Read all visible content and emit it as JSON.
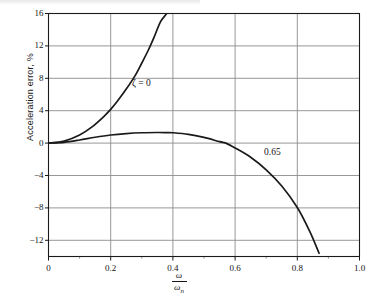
{
  "figure": {
    "background": "#ffffff",
    "ink_color": "#141414",
    "grid_color": "#8c8c8c",
    "frame_color": "#1a1a1a"
  },
  "axes": {
    "y_label": "Acceleration error, %",
    "x_label_numerator": "ω",
    "x_label_denominator": "ω",
    "x_label_denominator_sub": "n",
    "y_tick_labels": [
      "16",
      "12",
      "8",
      "4",
      "0",
      "−4",
      "−8",
      "−12"
    ],
    "y_tick_values": [
      16,
      12,
      8,
      4,
      0,
      -4,
      -8,
      -12
    ],
    "x_tick_labels": [
      "0",
      "0.2",
      "0.4",
      "0.6",
      "0.8",
      "1.0"
    ],
    "x_tick_values": [
      0,
      0.2,
      0.4,
      0.6,
      0.8,
      1.0
    ],
    "x_minor_tick_values": [
      0.1,
      0.3,
      0.5,
      0.7,
      0.9
    ]
  },
  "annotations": [
    {
      "name": "zeta-zero-label",
      "text": "ζ = 0"
    },
    {
      "name": "zeta-065-label",
      "text": "0.65"
    }
  ],
  "chart_data": {
    "type": "line",
    "title": "",
    "xlabel": "ω/ωn",
    "ylabel": "Acceleration error, %",
    "xlim": [
      0.0,
      1.0
    ],
    "ylim": [
      -14.0,
      16.0
    ],
    "grid": true,
    "legend": "inline-annotations",
    "x_ticks": [
      0,
      0.2,
      0.4,
      0.6,
      0.8,
      1.0
    ],
    "y_ticks": [
      -12,
      -8,
      -4,
      0,
      4,
      8,
      12,
      16
    ],
    "series": [
      {
        "name": "ζ = 0",
        "label": "ζ = 0",
        "color": "#1a1a1a",
        "x": [
          0.0,
          0.05,
          0.1,
          0.14,
          0.18,
          0.2,
          0.22,
          0.25,
          0.28,
          0.3,
          0.32,
          0.34,
          0.36,
          0.38,
          0.39
        ],
        "y": [
          0.0,
          0.25,
          1.01,
          2.0,
          3.36,
          4.17,
          5.1,
          6.67,
          8.43,
          9.89,
          11.4,
          13.12,
          14.96,
          16.0,
          16.6
        ]
      },
      {
        "name": "0.65",
        "label": "0.65",
        "color": "#1a1a1a",
        "x": [
          0.0,
          0.05,
          0.1,
          0.15,
          0.2,
          0.25,
          0.3,
          0.35,
          0.38,
          0.4,
          0.45,
          0.5,
          0.55,
          0.57,
          0.6,
          0.65,
          0.7,
          0.75,
          0.8,
          0.84,
          0.87
        ],
        "y": [
          0.0,
          0.1,
          0.38,
          0.72,
          1.0,
          1.18,
          1.28,
          1.31,
          1.3,
          1.28,
          1.08,
          0.7,
          0.18,
          0.0,
          -0.6,
          -1.75,
          -3.3,
          -5.3,
          -7.95,
          -10.9,
          -13.6
        ]
      }
    ]
  }
}
